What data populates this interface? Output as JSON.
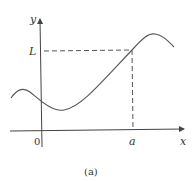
{
  "figure": {
    "caption": "(a)",
    "axes": {
      "x_label": "x",
      "y_label": "y",
      "origin_label": "0"
    },
    "marks": {
      "x_mark": "a",
      "y_mark": "L"
    },
    "colors": {
      "curve": "#555555",
      "axes": "#444444",
      "dashed": "#555555"
    }
  }
}
